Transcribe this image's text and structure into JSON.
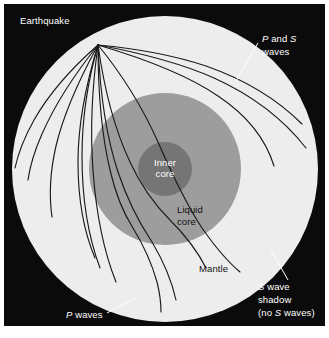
{
  "figure": {
    "background_color": "#ffffff",
    "frame_color": "#0b0b0b",
    "frame": {
      "x": 4,
      "y": 4,
      "width": 321,
      "height": 322
    }
  },
  "colors": {
    "background_dark": "#0b0b0b",
    "mantle": "#ededed",
    "liquid_core": "#9d9d9d",
    "inner_core": "#757575",
    "ray_line": "#1a1a1a",
    "leader_line": "#ffffff",
    "label_light": "#ffffff",
    "label_dark": "#111111"
  },
  "earth": {
    "center_x": 165,
    "center_y": 169,
    "surface_radius": 153,
    "liquid_core_radius": 76,
    "inner_core_radius": 27
  },
  "focus": {
    "label": "earthquake-focus",
    "x": 98,
    "y": 45
  },
  "layers": [
    {
      "name": "mantle",
      "label": "Mantle",
      "label_x": 199,
      "label_y": 269,
      "label_color": "dark"
    },
    {
      "name": "liquid-core",
      "label_line1": "Liquid",
      "label_line2": "core",
      "label_x": 185,
      "label_y": 211,
      "label_color": "dark"
    },
    {
      "name": "inner-core",
      "label_line1": "Inner",
      "label_line2": "core",
      "label_x": 165,
      "label_y": 163,
      "label_color": "light"
    }
  ],
  "annotations": {
    "earthquake": {
      "text": "Earthquake",
      "x": 20,
      "y": 22,
      "color": "light"
    },
    "p_and_s_waves": {
      "line1_a": "P",
      "line1_b": " and ",
      "line1_c": "S",
      "line2": "waves",
      "x": 262,
      "y": 40,
      "color": "light",
      "leader": {
        "x1": 258,
        "y1": 43,
        "x2": 236,
        "y2": 81
      }
    },
    "p_waves": {
      "line1_a": "P",
      "line1_b": " waves",
      "x": 66,
      "y": 316,
      "color": "light",
      "leader": {
        "x1": 107,
        "y1": 313,
        "x2": 135,
        "y2": 298
      }
    },
    "s_wave_shadow": {
      "line1_a": "S",
      "line1_b": " wave",
      "line2": "shadow",
      "line3_a": "(no ",
      "line3_b": "S",
      "line3_c": " waves)",
      "x": 258,
      "y": 288,
      "color": "light",
      "leader": {
        "x1": 288,
        "y1": 280,
        "x2": 271,
        "y2": 250
      }
    }
  },
  "ray_paths": {
    "description": "Seismic ray paths radiating from the earthquake focus",
    "count": 13,
    "paths": [
      {
        "name": "mantle-ray-left-1",
        "type": "P and S",
        "d": "M98,45 C78,70 56,102 42,134 C34,152 30,166 28,180"
      },
      {
        "name": "mantle-ray-left-2",
        "type": "P and S",
        "d": "M98,45 C80,78 64,112 56,146 C50,172 49,196 52,217"
      },
      {
        "name": "mantle-ray-left-3",
        "type": "P and S",
        "d": "M98,45 C86,84 78,124 78,162 C78,198 84,232 95,258"
      },
      {
        "name": "mantle-ray-left-4",
        "type": "P and S",
        "d": "M98,45 C92,88 90,130 93,170 C96,212 104,252 116,282"
      },
      {
        "name": "core-ray-1",
        "type": "P",
        "d": "M98,45 C98,90 101,132 110,170 C116,196 124,214 133,228 C144,246 152,264 157,282 C160,294 161,304 161,312"
      },
      {
        "name": "core-ray-2",
        "type": "P",
        "d": "M98,45 C104,88 114,128 130,162 C142,188 156,206 170,220 C186,236 198,252 206,268"
      },
      {
        "name": "surface-ray-right-1",
        "type": "P and S",
        "d": "M98,45 C130,48 170,54 206,66 C246,80 278,100 302,124"
      },
      {
        "name": "surface-ray-right-2",
        "type": "P and S",
        "d": "M98,45 C136,52 178,62 214,78 C254,96 284,120 306,148"
      },
      {
        "name": "surface-ray-right-3",
        "type": "P and S",
        "d": "M98,45 C142,58 186,74 218,96 C248,116 266,140 274,166"
      },
      {
        "name": "core-ray-3",
        "type": "P",
        "d": "M98,45 C120,72 142,106 158,142 C172,174 186,204 202,228 C216,248 228,262 240,272"
      },
      {
        "name": "mantle-ray-left-5",
        "type": "P and S",
        "d": "M98,45 C74,66 50,92 34,120 C24,138 18,154 15,168"
      },
      {
        "name": "mantle-ray-left-6",
        "type": "P and S",
        "d": "M98,45 C88,80 82,118 82,156 C82,196 88,236 100,268"
      },
      {
        "name": "core-ray-4",
        "type": "P",
        "d": "M98,45 C100,92 106,136 118,172 C128,202 140,224 152,242 C164,262 172,282 176,300"
      }
    ]
  }
}
